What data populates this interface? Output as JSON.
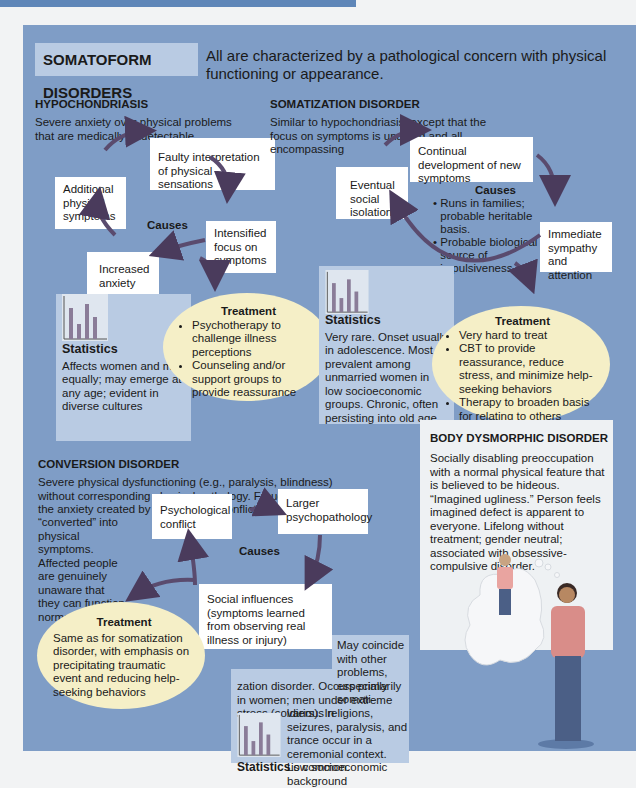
{
  "header": {
    "title": "SOMATOFORM DISORDERS",
    "intro": "All are characterized by a pathological concern with physical functioning or appearance."
  },
  "colors": {
    "panel": "#7f9dc6",
    "tab": "#b9cbe3",
    "box": "#ffffff",
    "treatment_ellipse": "#f5efc7",
    "stat_box": "#b9cbe3",
    "arrow": "#4a3b5c"
  },
  "hypochondriasis": {
    "title": "HYPOCHONDRIASIS",
    "description": "Severe anxiety over physical problems that are medically undetectable",
    "causes_label": "Causes",
    "cycle": [
      "Faulty interpretation of physical sensations",
      "Intensified focus on symptoms",
      "Increased anxiety",
      "Additional physical symptoms"
    ],
    "treatment": {
      "label": "Treatment",
      "items": [
        "Psychotherapy to challenge illness perceptions",
        "Counseling and/or support groups to provide reassurance"
      ]
    },
    "statistics": {
      "label": "Statistics",
      "text": "Affects women and men equally; may emerge at any age; evident in diverse cultures"
    }
  },
  "somatization": {
    "title": "SOMATIZATION DISORDER",
    "description": "Similar to hypochondriasis, except that the focus on symptoms is unafraid and all-encompassing",
    "causes_label": "Causes",
    "causes": [
      "Runs in families; probable heritable basis.",
      "Probable biological source of impulsiveness"
    ],
    "cycle": [
      "Continual development of new symptoms",
      "Immediate sympathy and attention",
      "Eventual social isolation"
    ],
    "treatment": {
      "label": "Treatment",
      "items": [
        "Very hard to treat",
        "CBT to provide reassurance, reduce stress, and minimize help-seeking behaviors",
        "Therapy to broaden basis for relating to others"
      ]
    },
    "statistics": {
      "label": "Statistics",
      "text": "Very rare. Onset usually in adolescence. Most prevalent among unmarried women in low socioeconomic groups. Chronic, often persisting into old age."
    }
  },
  "conversion": {
    "title": "CONVERSION DISORDER",
    "description_top": "Severe physical dysfunctioning (e.g., paralysis, blindness) without corresponding physical pathology. Freud believed the anxiety created by unconscious conflicts was",
    "description_side": "“converted” into physical symptoms. Affected people are genuinely unaware that they can function normally.",
    "causes_label": "Causes",
    "cycle": [
      "Psychological conflict",
      "Larger psychopathology",
      "Social influences (symptoms learned from observing real illness or injury)"
    ],
    "treatment": {
      "label": "Treatment",
      "text": "Same as for somatization disorder, with emphasis on precipitating traumatic event and reducing help-seeking behaviors"
    },
    "statistics": {
      "label": "Statistics",
      "text_top": "May coincide with other problems, especially somati-",
      "text_mid": "zation disorder. Occurs primarily in women; men under extreme stress (soldiers). In",
      "text_side": "various religions, seizures, paralysis, and trance occur in a ceremonial context. Low socioeconomic background",
      "text_end": "is common."
    }
  },
  "body_dysmorphic": {
    "title": "BODY DYSMORPHIC DISORDER",
    "description": "Socially disabling preoccupation with a normal physical feature that is believed to be hideous. “Imagined ugliness.” Person feels imagined defect is apparent to everyone. Lifelong without treatment; gender neutral; associated with obsessive-compulsive disorder."
  },
  "icons": {
    "stat_chart": "bar-chart-icon",
    "arrow": "curved-arrow-icon"
  }
}
